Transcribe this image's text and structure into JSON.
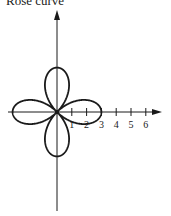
{
  "chart_data": {
    "type": "line",
    "title": "Rose curve",
    "curve": "polar rose with 4 petals along the axes, r = 3 cos(2θ)",
    "petal_count": 4,
    "petal_length": 3,
    "xlabel": "",
    "ylabel": "",
    "x_ticks": [
      1,
      2,
      3,
      4,
      5,
      6
    ],
    "x_tick_labels": [
      "1",
      "2",
      "3",
      "4",
      "5",
      "6"
    ],
    "xlim": [
      -3.3,
      7
    ],
    "ylim": [
      -6.7,
      7
    ],
    "grid": false,
    "legend": null
  },
  "colors": {
    "ink": "#1a1a1a",
    "background": "#ffffff"
  }
}
